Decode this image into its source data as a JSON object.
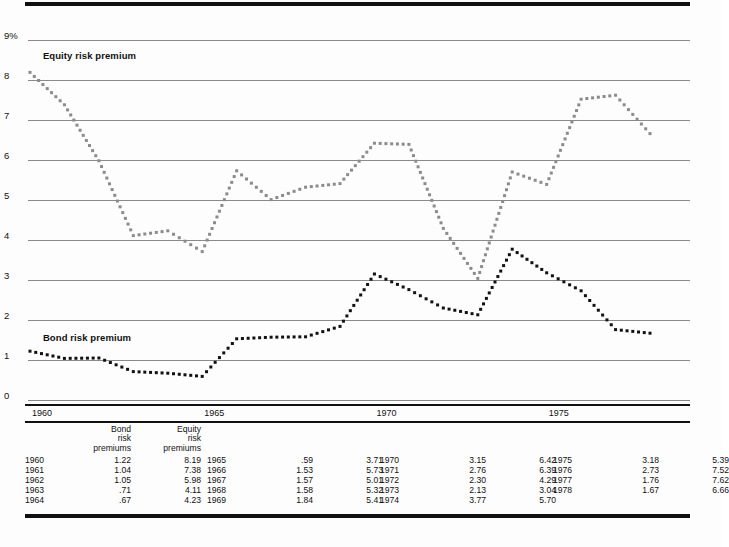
{
  "chart_data": {
    "type": "line",
    "title": "",
    "xlabel": "",
    "ylabel": "",
    "ylim": [
      0,
      9
    ],
    "xlim": [
      1960,
      1978
    ],
    "grid": true,
    "y_ticks": [
      "0",
      "1",
      "2",
      "3",
      "4",
      "5",
      "6",
      "7",
      "8",
      "9%"
    ],
    "x_ticks": [
      "1960",
      "1965",
      "1970",
      "1975"
    ],
    "x": [
      1960,
      1961,
      1962,
      1963,
      1964,
      1965,
      1966,
      1967,
      1968,
      1969,
      1970,
      1971,
      1972,
      1973,
      1974,
      1975,
      1976,
      1977,
      1978
    ],
    "series": [
      {
        "name": "Equity risk premium",
        "color": "#8b8b8b",
        "style": "dotted",
        "values": [
          8.19,
          7.38,
          5.98,
          4.11,
          4.23,
          3.71,
          5.73,
          5.01,
          5.32,
          5.41,
          6.42,
          6.39,
          4.29,
          3.04,
          5.7,
          5.39,
          7.52,
          7.62,
          6.66
        ]
      },
      {
        "name": "Bond risk premium",
        "color": "#111111",
        "style": "dotted",
        "values": [
          1.22,
          1.04,
          1.05,
          0.71,
          0.67,
          0.59,
          1.53,
          1.57,
          1.58,
          1.84,
          3.15,
          2.76,
          2.3,
          2.13,
          3.77,
          3.18,
          2.73,
          1.76,
          1.67
        ]
      }
    ],
    "annotations": [
      {
        "text": "Equity risk premium",
        "x": 1960.2,
        "y": 8.6
      },
      {
        "text": "Bond risk premium",
        "x": 1960.2,
        "y": 1.55
      }
    ]
  },
  "table": {
    "headers": [
      "Bond risk premiums",
      "Equity risk premiums"
    ],
    "header_lines": {
      "bond": [
        "Bond",
        "risk",
        "premiums"
      ],
      "equity": [
        "Equity",
        "risk",
        "premiums"
      ]
    },
    "groups": [
      {
        "rows": [
          {
            "year": "1960",
            "bond": "1.22",
            "equity": "8.19"
          },
          {
            "year": "1961",
            "bond": "1.04",
            "equity": "7.38"
          },
          {
            "year": "1962",
            "bond": "1.05",
            "equity": "5.98"
          },
          {
            "year": "1963",
            "bond": ".71",
            "equity": "4.11"
          },
          {
            "year": "1964",
            "bond": ".67",
            "equity": "4.23"
          }
        ]
      },
      {
        "rows": [
          {
            "year": "1965",
            "bond": ".59",
            "equity": "3.71"
          },
          {
            "year": "1966",
            "bond": "1.53",
            "equity": "5.73"
          },
          {
            "year": "1967",
            "bond": "1.57",
            "equity": "5.01"
          },
          {
            "year": "1968",
            "bond": "1.58",
            "equity": "5.32"
          },
          {
            "year": "1969",
            "bond": "1.84",
            "equity": "5.41"
          }
        ]
      },
      {
        "rows": [
          {
            "year": "1970",
            "bond": "3.15",
            "equity": "6.42"
          },
          {
            "year": "1971",
            "bond": "2.76",
            "equity": "6.39"
          },
          {
            "year": "1972",
            "bond": "2.30",
            "equity": "4.29"
          },
          {
            "year": "1973",
            "bond": "2.13",
            "equity": "3.04"
          },
          {
            "year": "1974",
            "bond": "3.77",
            "equity": "5.70"
          }
        ]
      },
      {
        "rows": [
          {
            "year": "1975",
            "bond": "3.18",
            "equity": "5.39"
          },
          {
            "year": "1976",
            "bond": "2.73",
            "equity": "7.52"
          },
          {
            "year": "1977",
            "bond": "1.76",
            "equity": "7.62"
          },
          {
            "year": "1978",
            "bond": "1.67",
            "equity": "6.66"
          }
        ]
      }
    ]
  }
}
